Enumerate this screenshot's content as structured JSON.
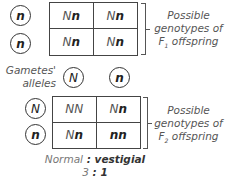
{
  "f1": {
    "row_alleles": [
      "n",
      "n"
    ],
    "cells": [
      {
        "plain": "N",
        "bold": "n"
      },
      {
        "plain": "N",
        "bold": "n"
      },
      {
        "plain": "N",
        "bold": "n"
      },
      {
        "plain": "N",
        "bold": "n"
      }
    ],
    "label_line1": "Possible",
    "label_line2": "genotypes of",
    "label_f": "F",
    "label_sub": "1",
    "label_line3": " offspring"
  },
  "gametes": {
    "label_line1": "Gametes'",
    "label_line2": "alleles",
    "alleles": [
      "N",
      "n"
    ]
  },
  "f2": {
    "row_alleles": [
      "N",
      "n"
    ],
    "cells": [
      {
        "plain": "NN",
        "bold": ""
      },
      {
        "plain": "N",
        "bold": "n"
      },
      {
        "plain": "N",
        "bold": "n"
      },
      {
        "plain": "",
        "bold": "nn"
      }
    ],
    "label_line1": "Possible",
    "label_line2": "genotypes of",
    "label_f": "F",
    "label_sub": "2",
    "label_line3": " offspring"
  },
  "ratio": {
    "normal": "Normal",
    "separator": " : ",
    "vestigial": "vestigial",
    "left": "3",
    "colon": " : ",
    "right": "1"
  }
}
